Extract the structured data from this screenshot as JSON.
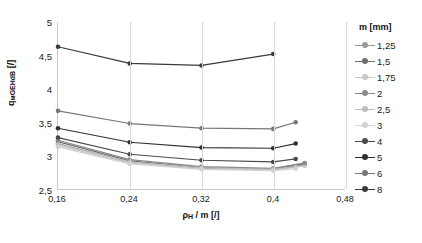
{
  "chart_data": {
    "type": "line",
    "title": "",
    "xlabel": "ρH / m [/]",
    "xlabel_base": "ρ",
    "xlabel_sub": "H",
    "xlabel_rest": " / m [/]",
    "ylabel": "qмGEHdB [/]",
    "ylabel_base": "q",
    "ylabel_sub": "мGEHdB",
    "ylabel_rest": " [/]",
    "xlim": [
      0.16,
      0.48
    ],
    "ylim": [
      2.5,
      5.0
    ],
    "xticks": [
      "0,16",
      "0,24",
      "0,32",
      "0,4",
      "0,48"
    ],
    "xtick_values": [
      0.16,
      0.24,
      0.32,
      0.4,
      0.48
    ],
    "yticks": [
      "2,5",
      "3",
      "3,5",
      "4",
      "4,5",
      "5"
    ],
    "ytick_values": [
      2.5,
      3.0,
      3.5,
      4.0,
      4.5,
      5.0
    ],
    "grid": "vertical",
    "legend_position": "right",
    "legend_title": "m [mm]",
    "series": [
      {
        "name": "1,25",
        "color": "#9a9a9a",
        "x": [
          0.16,
          0.24,
          0.32,
          0.4,
          0.435
        ],
        "values": [
          3.18,
          2.9,
          2.81,
          2.79,
          2.86
        ]
      },
      {
        "name": "1,5",
        "color": "#6e6e6e",
        "x": [
          0.16,
          0.24,
          0.32,
          0.4,
          0.435
        ],
        "values": [
          3.21,
          2.92,
          2.82,
          2.8,
          2.88
        ]
      },
      {
        "name": "1,75",
        "color": "#c8c8c8",
        "x": [
          0.16,
          0.24,
          0.32,
          0.4,
          0.435
        ],
        "values": [
          3.15,
          2.89,
          2.8,
          2.785,
          2.845
        ]
      },
      {
        "name": "2",
        "color": "#8a8a8a",
        "x": [
          0.16,
          0.24,
          0.32,
          0.4,
          0.435
        ],
        "values": [
          3.23,
          2.94,
          2.835,
          2.81,
          2.89
        ]
      },
      {
        "name": "2,5",
        "color": "#bdbdbd",
        "x": [
          0.16,
          0.24,
          0.32,
          0.4,
          0.425
        ],
        "values": [
          3.17,
          2.905,
          2.815,
          2.795,
          2.83
        ]
      },
      {
        "name": "3",
        "color": "#d2d2d2",
        "x": [
          0.16,
          0.24,
          0.32,
          0.4,
          0.425
        ],
        "values": [
          3.13,
          2.875,
          2.795,
          2.775,
          2.805
        ]
      },
      {
        "name": "4",
        "color": "#4a4a4a",
        "x": [
          0.16,
          0.24,
          0.32,
          0.4,
          0.425
        ],
        "values": [
          3.27,
          3.02,
          2.93,
          2.905,
          2.95
        ]
      },
      {
        "name": "5",
        "color": "#303030",
        "x": [
          0.16,
          0.24,
          0.32,
          0.4,
          0.425
        ],
        "values": [
          3.41,
          3.2,
          3.12,
          3.11,
          3.18
        ]
      },
      {
        "name": "6",
        "color": "#777777",
        "x": [
          0.16,
          0.24,
          0.32,
          0.4,
          0.425
        ],
        "values": [
          3.67,
          3.48,
          3.41,
          3.4,
          3.5
        ]
      },
      {
        "name": "8",
        "color": "#3a3a3a",
        "x": [
          0.16,
          0.24,
          0.32,
          0.4
        ],
        "values": [
          4.63,
          4.38,
          4.35,
          4.52
        ]
      }
    ]
  }
}
